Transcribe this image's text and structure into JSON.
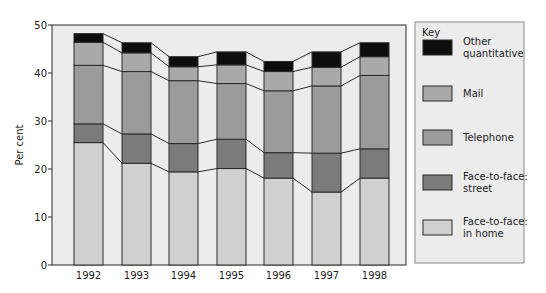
{
  "chart_data": {
    "type": "bar",
    "stacked": true,
    "title": "",
    "xlabel": "",
    "ylabel": "Per cent",
    "ylim": [
      0,
      50
    ],
    "yticks": [
      0,
      10,
      20,
      30,
      40,
      50
    ],
    "grid": false,
    "connector_lines": true,
    "legend_position": "right",
    "legend_title": "Key",
    "categories": [
      "1992",
      "1993",
      "1994",
      "1995",
      "1996",
      "1997",
      "1998"
    ],
    "series": [
      {
        "name": "Face-to-face: in home",
        "label_lines": [
          "Face-to-face:",
          "in home"
        ],
        "color": "#d0d0d0",
        "values": [
          25.5,
          21.2,
          19.4,
          20.1,
          18.1,
          15.2,
          18.1
        ]
      },
      {
        "name": "Face-to-face: street",
        "label_lines": [
          "Face-to-face:",
          "street"
        ],
        "color": "#7b7b7b",
        "values": [
          3.9,
          6.1,
          5.9,
          6.1,
          5.3,
          8.1,
          6.1
        ]
      },
      {
        "name": "Telephone",
        "label_lines": [
          "Telephone"
        ],
        "color": "#9b9b9b",
        "values": [
          12.2,
          13.0,
          13.1,
          11.6,
          12.9,
          14.0,
          15.3
        ]
      },
      {
        "name": "Mail",
        "label_lines": [
          "Mail"
        ],
        "color": "#a9a9a9",
        "values": [
          4.8,
          3.9,
          2.9,
          3.9,
          4.0,
          3.9,
          3.9
        ]
      },
      {
        "name": "Other quantitative",
        "label_lines": [
          "Other",
          "quantitative"
        ],
        "color": "#0d0d0d",
        "values": [
          1.8,
          2.1,
          2.1,
          2.7,
          2.1,
          3.2,
          2.9
        ]
      }
    ],
    "totals": [
      48.2,
      46.3,
      43.4,
      44.4,
      42.4,
      44.4,
      46.3
    ]
  },
  "style": {
    "plot_background": "#ececec",
    "legend_background": "#ececec",
    "line_color": "#2a2a2a"
  }
}
